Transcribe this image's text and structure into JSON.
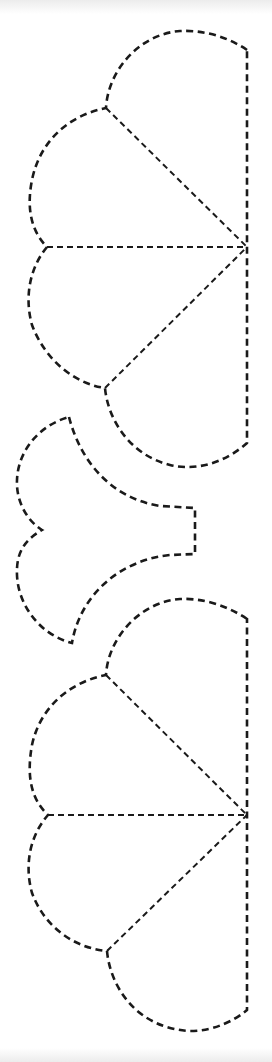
{
  "diagram": {
    "type": "dashed cut-out template",
    "stroke_color": "#1a1a1a",
    "background": "#ffffff",
    "shapes": [
      {
        "name": "upper-fan-piece",
        "description": "Three-lobed fan piece with straight right edge and three dashed fold lines meeting at a point on the right edge",
        "right_edge": {
          "x": 247,
          "y_top": 50,
          "y_bottom": 443
        },
        "apex": [
          247,
          247
        ],
        "joints": [
          [
            106,
            108
          ],
          [
            47,
            247
          ],
          [
            105,
            388
          ]
        ]
      },
      {
        "name": "middle-tab-piece",
        "description": "Two-lobed piece with notch on left and rectangular tab on right",
        "tips": [
          [
            69,
            417
          ],
          [
            72,
            643
          ]
        ],
        "notch": [
          42,
          530
        ],
        "tab": {
          "x": 195,
          "y_top": 508,
          "y_bottom": 554
        }
      },
      {
        "name": "lower-fan-piece",
        "description": "Three-lobed fan piece, same as upper piece",
        "right_edge": {
          "x": 247,
          "y_top": 619,
          "y_bottom": 1010
        },
        "apex": [
          247,
          815
        ],
        "joints": [
          [
            106,
            675
          ],
          [
            48,
            815
          ],
          [
            107,
            951
          ]
        ]
      }
    ]
  }
}
